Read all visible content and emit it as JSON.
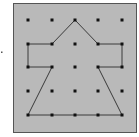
{
  "diagram": {
    "type": "geoboard",
    "colors": {
      "background": "#ffffff",
      "board_fill": "#b9b9b9",
      "board_border": "#555555",
      "peg": "#111111",
      "polygon_stroke": "#3a3a3a",
      "marker": "#555555"
    },
    "board": {
      "x": 13,
      "y": 3,
      "width": 123,
      "height": 129
    },
    "grid": {
      "cols": 5,
      "rows": 5,
      "x": [
        28,
        52,
        75,
        98,
        122
      ],
      "y": [
        20,
        44,
        67,
        91,
        115
      ]
    },
    "polygon_vertices": [
      [
        2,
        0
      ],
      [
        3,
        1
      ],
      [
        4,
        1
      ],
      [
        4,
        2
      ],
      [
        3,
        2
      ],
      [
        4,
        4
      ],
      [
        0,
        4
      ],
      [
        1,
        2
      ],
      [
        0,
        2
      ],
      [
        0,
        1
      ],
      [
        1,
        1
      ]
    ],
    "side_marker": {
      "x": 1.5,
      "y": 52
    }
  }
}
